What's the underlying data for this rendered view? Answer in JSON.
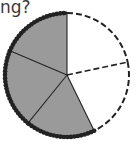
{
  "question": {
    "text": "ng?"
  },
  "diagram": {
    "type": "fraction-circle",
    "total_parts": 5,
    "shaded_parts": 3,
    "unshaded_parts": 2,
    "colors": {
      "shaded": "#9a9a9a",
      "unshaded": "#ffffff",
      "line": "#222222"
    },
    "center": [
      67,
      75
    ],
    "radius": 62,
    "boundary_angles_deg": [
      -90,
      -12,
      64,
      129,
      203
    ],
    "sectors": [
      {
        "start": -90,
        "end": -12,
        "shaded": false,
        "edge": "dashed"
      },
      {
        "start": -12,
        "end": 64,
        "shaded": false,
        "edge": "dashed"
      },
      {
        "start": 64,
        "end": 129,
        "shaded": true,
        "edge": "beaded"
      },
      {
        "start": 129,
        "end": 203,
        "shaded": true,
        "edge": "beaded"
      },
      {
        "start": 203,
        "end": 270,
        "shaded": true,
        "edge": "beaded"
      }
    ]
  }
}
